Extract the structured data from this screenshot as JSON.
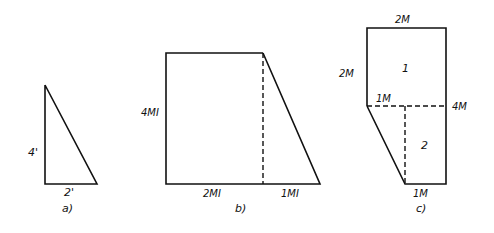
{
  "figures": {
    "a": {
      "caption": "a)",
      "height_label": "4'",
      "base_label": "2'"
    },
    "b": {
      "caption": "b)",
      "height_label": "4MI",
      "left_base_label": "2MI",
      "right_base_label": "1MI"
    },
    "c": {
      "caption": "c)",
      "top_label": "2M",
      "left_label": "2M",
      "mid_label": "1M",
      "right_label": "4M",
      "bottom_label": "1M",
      "region_1": "1",
      "region_2": "2"
    }
  }
}
